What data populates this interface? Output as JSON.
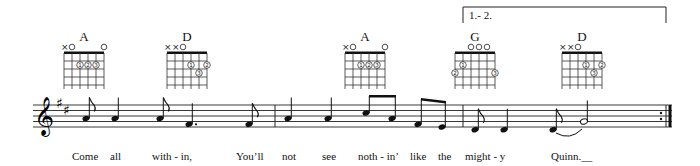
{
  "score": {
    "clef": "treble",
    "key_signature": "D major (2 sharps)",
    "volta": {
      "label": "1.- 2."
    },
    "chords": [
      {
        "name": "A",
        "x": 84,
        "markers": [
          "x",
          "o",
          "",
          "",
          "",
          "o"
        ],
        "fingers": [
          {
            "string": 2,
            "fret": 2,
            "finger": "1"
          },
          {
            "string": 3,
            "fret": 2,
            "finger": "2"
          },
          {
            "string": 4,
            "fret": 2,
            "finger": "3"
          }
        ]
      },
      {
        "name": "D",
        "x": 187,
        "markers": [
          "x",
          "x",
          "o",
          "",
          "",
          ""
        ],
        "fingers": [
          {
            "string": 3,
            "fret": 2,
            "finger": "1"
          },
          {
            "string": 5,
            "fret": 2,
            "finger": "2"
          },
          {
            "string": 4,
            "fret": 3,
            "finger": "3"
          }
        ]
      },
      {
        "name": "A",
        "x": 365,
        "markers": [
          "x",
          "o",
          "",
          "",
          "",
          "o"
        ],
        "fingers": [
          {
            "string": 2,
            "fret": 2,
            "finger": "1"
          },
          {
            "string": 3,
            "fret": 2,
            "finger": "2"
          },
          {
            "string": 4,
            "fret": 2,
            "finger": "3"
          }
        ]
      },
      {
        "name": "G",
        "x": 475,
        "markers": [
          "",
          "",
          "o",
          "o",
          "o",
          ""
        ],
        "fingers": [
          {
            "string": 1,
            "fret": 2,
            "finger": "1"
          },
          {
            "string": 0,
            "fret": 3,
            "finger": "2"
          },
          {
            "string": 5,
            "fret": 3,
            "finger": "3"
          }
        ]
      },
      {
        "name": "D",
        "x": 582,
        "markers": [
          "x",
          "x",
          "o",
          "",
          "",
          ""
        ],
        "fingers": [
          {
            "string": 3,
            "fret": 2,
            "finger": "1"
          },
          {
            "string": 5,
            "fret": 2,
            "finger": "2"
          },
          {
            "string": 4,
            "fret": 3,
            "finger": "3"
          }
        ]
      }
    ],
    "lyrics": [
      {
        "text": "Come",
        "x": 72
      },
      {
        "text": "all",
        "x": 110
      },
      {
        "text": "with - in,",
        "x": 152
      },
      {
        "text": "You’ll",
        "x": 236
      },
      {
        "text": "not",
        "x": 282
      },
      {
        "text": "see",
        "x": 322
      },
      {
        "text": "noth - in’",
        "x": 358
      },
      {
        "text": "like",
        "x": 410
      },
      {
        "text": "the",
        "x": 438
      },
      {
        "text": "might - y",
        "x": 465
      },
      {
        "text": "Quinn.__",
        "x": 551
      }
    ]
  }
}
